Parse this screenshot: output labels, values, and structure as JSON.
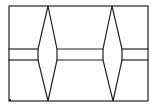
{
  "diagram": {
    "type": "line-drawing",
    "colors": {
      "background": "#ffffff",
      "stroke": "#222222"
    },
    "stroke_width": 1.2,
    "frame": {
      "x1": 9,
      "y1": 6,
      "x2": 148,
      "y2": 101
    },
    "bar": {
      "y_top": 49,
      "y_bottom": 60
    },
    "lenses": [
      {
        "id": "lens-left",
        "top": [
          48,
          6
        ],
        "bottom": [
          48,
          101
        ],
        "left_x": 38,
        "right_x": 57
      },
      {
        "id": "lens-right",
        "top": [
          112,
          6
        ],
        "bottom": [
          113,
          101
        ],
        "left_x": 103,
        "right_x": 122
      }
    ],
    "marks": [
      {
        "id": "corner-dot",
        "x": 10,
        "y": 100
      }
    ]
  }
}
